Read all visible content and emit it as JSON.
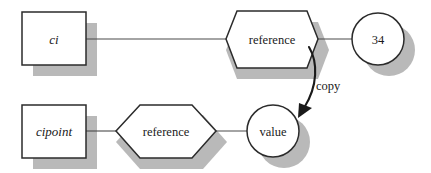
{
  "diagram": {
    "colors": {
      "background": "#ffffff",
      "shape_fill": "#ffffff",
      "shape_stroke": "#2b2b2b",
      "shadow": "#b9b9b9",
      "line": "#4a4a4a",
      "arrow": "#1a1a1a",
      "text": "#1a1a1a"
    },
    "nodes": [
      {
        "id": "ci",
        "shape": "rectangle",
        "label": "ci",
        "style": "italic",
        "x": 22,
        "y": 12,
        "w": 64,
        "h": 53
      },
      {
        "id": "reference-top",
        "shape": "hexagon",
        "label": "reference",
        "style": "normal",
        "cx": 272,
        "cy": 39,
        "w": 93,
        "h": 57
      },
      {
        "id": "value-34",
        "shape": "circle",
        "label": "34",
        "style": "normal",
        "cx": 378,
        "cy": 39,
        "r": 26
      },
      {
        "id": "cipoint",
        "shape": "rectangle",
        "label": "cipoint",
        "style": "italic",
        "x": 22,
        "y": 105,
        "w": 64,
        "h": 53
      },
      {
        "id": "reference-bottom",
        "shape": "hexagon",
        "label": "reference",
        "style": "normal",
        "cx": 166,
        "cy": 131,
        "w": 101,
        "h": 54
      },
      {
        "id": "value",
        "shape": "circle",
        "label": "value",
        "style": "normal",
        "cx": 273,
        "cy": 131,
        "r": 26
      }
    ],
    "edges": [
      {
        "id": "ci-to-reference-top",
        "from": "ci",
        "to": "reference-top",
        "label": ""
      },
      {
        "id": "reference-top-to-34",
        "from": "reference-top",
        "to": "value-34",
        "label": ""
      },
      {
        "id": "cipoint-to-reference-bottom",
        "from": "cipoint",
        "to": "reference-bottom",
        "label": ""
      },
      {
        "id": "reference-bottom-to-value",
        "from": "reference-bottom",
        "to": "value",
        "label": ""
      },
      {
        "id": "copy-arrow",
        "from": "reference-top",
        "to": "value",
        "label": "copy",
        "arrow": true
      }
    ],
    "annotations": [
      {
        "id": "copy-label",
        "text": "copy",
        "x": 316,
        "y": 90
      }
    ]
  }
}
